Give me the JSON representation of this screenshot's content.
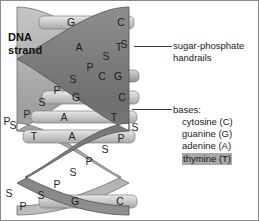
{
  "figure": {
    "background_color": "#ffffff",
    "border_color": "#8a8a8a"
  },
  "labels": {
    "dna_strand_line1": "DNA",
    "dna_strand_line2": "strand",
    "handrails_line1": "sugar-phosphate",
    "handrails_line2": "handrails",
    "bases_title": "bases:"
  },
  "bases_legend": {
    "items": [
      {
        "label": "cytosine (C)",
        "highlighted": false
      },
      {
        "label": "guanine (G)",
        "highlighted": false
      },
      {
        "label": "adenine (A)",
        "highlighted": false
      },
      {
        "label": "thymine (T)",
        "highlighted": true
      }
    ],
    "highlight_color": "#a8a8a8"
  },
  "base_pairs": [
    {
      "left": "G",
      "right": "C",
      "y": 22
    },
    {
      "left": "A",
      "right": "T",
      "y": 46
    },
    {
      "left": "C",
      "right": "G",
      "y": 76
    },
    {
      "left": "G",
      "right": "C",
      "y": 97
    },
    {
      "left": "A",
      "right": "T",
      "y": 117
    },
    {
      "left": "T",
      "right": "A",
      "y": 135
    },
    {
      "left": "G",
      "right": "C",
      "y": 200
    }
  ],
  "backbone_markers": {
    "sugar_symbol": "S",
    "phosphate_symbol": "P",
    "front_ribbon": [
      {
        "symbol": "S",
        "x": 105,
        "y": 55
      },
      {
        "symbol": "P",
        "x": 89,
        "y": 66
      },
      {
        "symbol": "S",
        "x": 72,
        "y": 78
      },
      {
        "symbol": "P",
        "x": 56,
        "y": 89
      },
      {
        "symbol": "S",
        "x": 41,
        "y": 101
      },
      {
        "symbol": "P",
        "x": 26,
        "y": 113
      },
      {
        "symbol": "S",
        "x": 14,
        "y": 125
      }
    ],
    "back_ribbon": [
      {
        "symbol": "S",
        "x": 123,
        "y": 43
      },
      {
        "symbol": "P",
        "x": 112,
        "y": 158
      },
      {
        "symbol": "S",
        "x": 97,
        "y": 147
      },
      {
        "symbol": "P",
        "x": 81,
        "y": 159
      },
      {
        "symbol": "S",
        "x": 65,
        "y": 171
      },
      {
        "symbol": "P",
        "x": 49,
        "y": 183
      },
      {
        "symbol": "S",
        "x": 33,
        "y": 195
      },
      {
        "symbol": "P",
        "x": 18,
        "y": 206
      },
      {
        "symbol": "P",
        "x": 120,
        "y": 137
      },
      {
        "symbol": "S",
        "x": 134,
        "y": 126
      }
    ]
  },
  "colors": {
    "ribbon_dark": "#7d7d7d",
    "ribbon_light": "#b9b9b9",
    "rung_light": "#d2d2d2",
    "rung_mid": "#bdbdbd",
    "text_dark": "#1a1a1a",
    "leader_line": "#3c3c3c"
  }
}
